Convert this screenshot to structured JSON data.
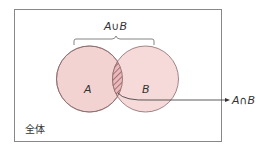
{
  "diagram": {
    "type": "venn",
    "universe_label": "全体",
    "set_a_label": "A",
    "set_b_label": "B",
    "union_label": "A∪B",
    "intersection_label": "A∩B",
    "colors": {
      "circle_fill": "#f3d3d2",
      "circle_stroke": "#8a6a6a",
      "hatch": "#9a5a60",
      "frame": "#888888",
      "text": "#333333"
    }
  }
}
